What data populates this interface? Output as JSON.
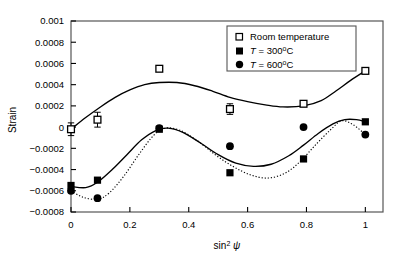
{
  "chart_data": {
    "type": "scatter",
    "title": "",
    "xlabel": "sin² ψ",
    "ylabel": "Strain",
    "xlim": [
      0,
      1.06
    ],
    "ylim": [
      -0.0008,
      0.001
    ],
    "xticks": [
      0,
      0.2,
      0.4,
      0.6,
      0.8,
      1
    ],
    "xticklabels": [
      "0",
      "0.2",
      "0.4",
      "0.6",
      "0.8",
      "1"
    ],
    "yticks": [
      -0.0008,
      -0.0006,
      -0.0004,
      -0.0002,
      0,
      0.0002,
      0.0004,
      0.0006,
      0.0008,
      0.001
    ],
    "yticklabels": [
      "−0.0008",
      "−0.0006",
      "−0.0004",
      "−0.0002",
      "0",
      "0.0002",
      "0.0004",
      "0.0006",
      "0.0008",
      "0.001"
    ],
    "grid": false,
    "legend_position": "top-right",
    "series": [
      {
        "name": "Room temperature",
        "marker": "open-square",
        "line": "solid",
        "x": [
          0.0,
          0.09,
          0.3,
          0.54,
          0.79,
          1.0
        ],
        "values": [
          -2e-05,
          7e-05,
          0.00055,
          0.00017,
          0.00022,
          0.00053
        ],
        "yerr": [
          6e-05,
          7e-05,
          0.0,
          5e-05,
          0.0,
          0.0
        ]
      },
      {
        "name": "T = 300°C",
        "marker": "filled-square",
        "line": "solid",
        "x": [
          0.0,
          0.09,
          0.3,
          0.54,
          0.79,
          1.0
        ],
        "values": [
          -0.00055,
          -0.0005,
          -2e-05,
          -0.00043,
          -0.0003,
          5e-05
        ],
        "yerr": [
          0.0,
          0.0,
          0.0,
          0.0,
          0.0,
          0.0
        ]
      },
      {
        "name": "T = 600°C",
        "marker": "filled-circle",
        "line": "dotted",
        "x": [
          0.0,
          0.09,
          0.3,
          0.54,
          0.79,
          1.0
        ],
        "values": [
          -0.0006,
          -0.00067,
          -1e-05,
          -0.00018,
          0.0,
          -7e-05
        ],
        "yerr": [
          0.0,
          0.0,
          0.0,
          0.0,
          0.0,
          0.0
        ]
      }
    ],
    "fit_curves": [
      {
        "name": "Room temperature fit",
        "style": "solid",
        "points": [
          [
            0.0,
            -2e-05
          ],
          [
            0.05,
            9e-05
          ],
          [
            0.1,
            0.00019
          ],
          [
            0.15,
            0.00028
          ],
          [
            0.2,
            0.00035
          ],
          [
            0.25,
            0.0004
          ],
          [
            0.3,
            0.00042
          ],
          [
            0.36,
            0.00042
          ],
          [
            0.42,
            0.00039
          ],
          [
            0.48,
            0.00034
          ],
          [
            0.54,
            0.00028
          ],
          [
            0.6,
            0.00024
          ],
          [
            0.66,
            0.00021
          ],
          [
            0.72,
            0.00019
          ],
          [
            0.79,
            0.0002
          ],
          [
            0.85,
            0.00025
          ],
          [
            0.9,
            0.00034
          ],
          [
            0.95,
            0.00044
          ],
          [
            1.0,
            0.00053
          ]
        ]
      },
      {
        "name": "T = 300°C fit",
        "style": "solid",
        "points": [
          [
            0.0,
            -0.00056
          ],
          [
            0.05,
            -0.00057
          ],
          [
            0.09,
            -0.00052
          ],
          [
            0.14,
            -0.0004
          ],
          [
            0.19,
            -0.00026
          ],
          [
            0.24,
            -0.00012
          ],
          [
            0.29,
            -3e-05
          ],
          [
            0.33,
            -1e-05
          ],
          [
            0.38,
            -5e-05
          ],
          [
            0.44,
            -0.00015
          ],
          [
            0.5,
            -0.00026
          ],
          [
            0.56,
            -0.00034
          ],
          [
            0.62,
            -0.00037
          ],
          [
            0.68,
            -0.00035
          ],
          [
            0.74,
            -0.00027
          ],
          [
            0.79,
            -0.00017
          ],
          [
            0.84,
            -6e-05
          ],
          [
            0.89,
            3e-05
          ],
          [
            0.93,
            7e-05
          ],
          [
            0.97,
            7e-05
          ],
          [
            1.0,
            5e-05
          ]
        ]
      },
      {
        "name": "T = 600°C fit",
        "style": "dotted",
        "points": [
          [
            0.0,
            -0.0006
          ],
          [
            0.04,
            -0.00066
          ],
          [
            0.09,
            -0.00068
          ],
          [
            0.13,
            -0.00062
          ],
          [
            0.18,
            -0.00046
          ],
          [
            0.23,
            -0.00026
          ],
          [
            0.28,
            -8e-05
          ],
          [
            0.32,
            -1e-05
          ],
          [
            0.37,
            -3e-05
          ],
          [
            0.43,
            -0.00013
          ],
          [
            0.49,
            -0.00026
          ],
          [
            0.55,
            -0.00037
          ],
          [
            0.61,
            -0.00045
          ],
          [
            0.67,
            -0.00048
          ],
          [
            0.73,
            -0.00043
          ],
          [
            0.78,
            -0.00032
          ],
          [
            0.83,
            -0.00017
          ],
          [
            0.88,
            -3e-05
          ],
          [
            0.92,
            6e-05
          ],
          [
            0.96,
            2e-05
          ],
          [
            1.0,
            -7e-05
          ]
        ]
      }
    ]
  },
  "legend": {
    "items": [
      {
        "label": "Room temperature",
        "marker": "open-square"
      },
      {
        "label": "T = 300°C",
        "marker": "filled-square"
      },
      {
        "label": "T = 600°C",
        "marker": "filled-circle"
      }
    ]
  },
  "colors": {
    "ink": "#000000",
    "background": "#ffffff",
    "frame": "#4d4d4d"
  }
}
